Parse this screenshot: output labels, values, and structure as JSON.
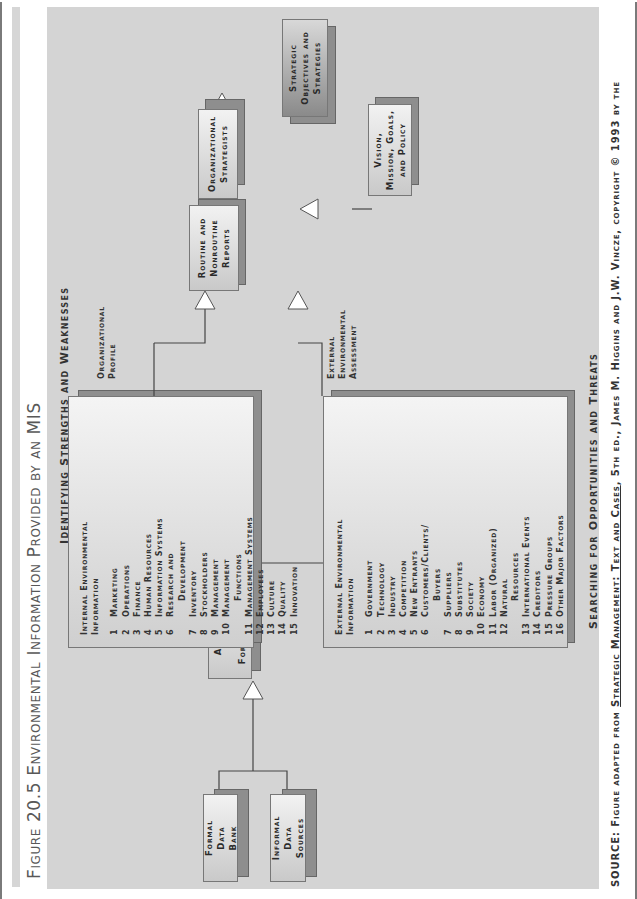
{
  "figure": {
    "title": "Figure 20.5  Environmental Information Provided by an MIS"
  },
  "captions": {
    "top": "Identifying Strengths and Weaknesses",
    "bottom": "Searching for Opportunities and Threats"
  },
  "nodes": {
    "formal_data_bank": "Formal\nData\nBank",
    "informal_data_sources": "Informal\nData\nSources",
    "analysis": "Analysis\nand\nForecasting",
    "reports": "Routine and\nNonroutine\nReports",
    "strategists": "Organizational\nStrategists",
    "vision": "Vision,\nMission, Goals,\nand Policy",
    "objectives": "Strategic\nObjectives and\nStrategies"
  },
  "internal": {
    "header": "Internal Environmental\nInformation",
    "side_label": "Organizational\nProfile",
    "items": [
      {
        "n": "1",
        "label": "Marketing"
      },
      {
        "n": "2",
        "label": "Operations"
      },
      {
        "n": "3",
        "label": "Finance"
      },
      {
        "n": "4",
        "label": "Human Resources"
      },
      {
        "n": "5",
        "label": "Information Systems"
      },
      {
        "n": "6",
        "label": "Research and"
      },
      {
        "n": "",
        "label": "Development"
      },
      {
        "n": "7",
        "label": "Inventory"
      },
      {
        "n": "8",
        "label": "Stockholders"
      },
      {
        "n": "9",
        "label": "Management"
      },
      {
        "n": "10",
        "label": "Management"
      },
      {
        "n": "",
        "label": "Functions"
      },
      {
        "n": "11",
        "label": "Management Systems"
      },
      {
        "n": "12",
        "label": "Employees"
      },
      {
        "n": "13",
        "label": "Culture"
      },
      {
        "n": "14",
        "label": "Quality"
      },
      {
        "n": "15",
        "label": "Innovation"
      }
    ]
  },
  "external": {
    "header": "External Environmental\nInformation",
    "side_label": "External\nEnvironmental\nAssessment",
    "items": [
      {
        "n": "1",
        "label": "Government"
      },
      {
        "n": "2",
        "label": "Technology"
      },
      {
        "n": "3",
        "label": "Industry"
      },
      {
        "n": "4",
        "label": "Competition"
      },
      {
        "n": "5",
        "label": "New Entrants"
      },
      {
        "n": "6",
        "label": "Customers/Clients/"
      },
      {
        "n": "",
        "label": "Buyers"
      },
      {
        "n": "7",
        "label": "Suppliers"
      },
      {
        "n": "8",
        "label": "Substitutes"
      },
      {
        "n": "9",
        "label": "Society"
      },
      {
        "n": "10",
        "label": "Economy"
      },
      {
        "n": "11",
        "label": "Labor (Organized)"
      },
      {
        "n": "12",
        "label": "Natural"
      },
      {
        "n": "",
        "label": "Resources"
      },
      {
        "n": "13",
        "label": "International Events"
      },
      {
        "n": "14",
        "label": "Creditors"
      },
      {
        "n": "15",
        "label": "Pressure Groups"
      },
      {
        "n": "16",
        "label": "Other Major Factors"
      }
    ]
  },
  "source": {
    "prefix": "SOURCE: Figure adapted from ",
    "book": "Strategic Management: Text and Cases",
    "suffix": ", 5th ed., James M. Higgins and J.W. Vincze, copyright © 1993 by the"
  }
}
